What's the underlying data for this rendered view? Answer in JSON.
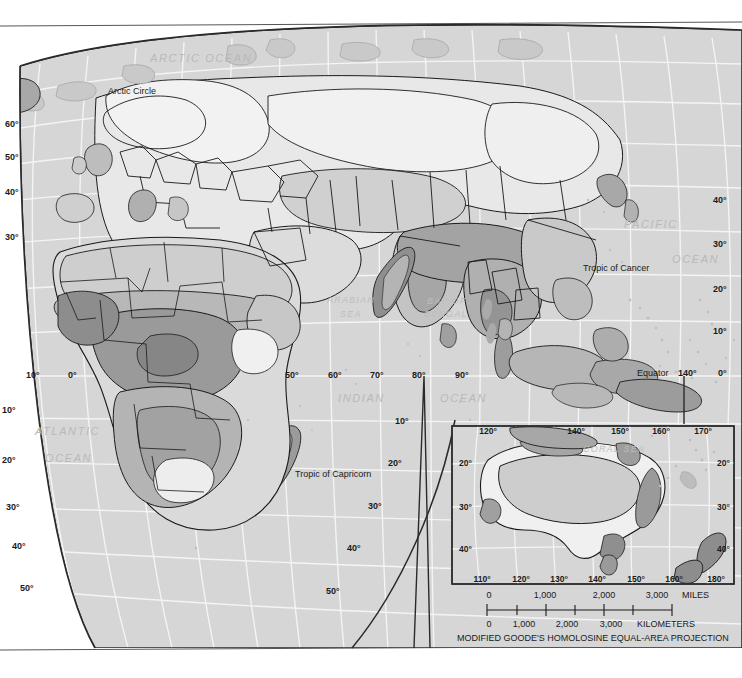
{
  "map": {
    "projection_caption": "MODIFIED GOODE'S HOMOLOSINE EQUAL-AREA PROJECTION",
    "ocean_labels": [
      {
        "name": "arctic-ocean",
        "text": "ARCTIC OCEAN",
        "x": 150,
        "y": 62
      },
      {
        "name": "atlantic-ocean-1",
        "text": "ATLANTIC",
        "x": 35,
        "y": 435
      },
      {
        "name": "atlantic-ocean-2",
        "text": "OCEAN",
        "x": 45,
        "y": 462
      },
      {
        "name": "pacific-ocean-1",
        "text": "PACIFIC",
        "x": 624,
        "y": 228
      },
      {
        "name": "pacific-ocean-2",
        "text": "OCEAN",
        "x": 672,
        "y": 263
      },
      {
        "name": "indian-ocean-1",
        "text": "INDIAN",
        "x": 338,
        "y": 402
      },
      {
        "name": "indian-ocean-2",
        "text": "OCEAN",
        "x": 440,
        "y": 402
      }
    ],
    "sea_labels": [
      {
        "name": "arabian-sea-1",
        "text": "ARABIAN",
        "x": 327,
        "y": 303
      },
      {
        "name": "arabian-sea-2",
        "text": "SEA",
        "x": 340,
        "y": 317
      },
      {
        "name": "bay-of-bengal-1",
        "text": "BAY OF",
        "x": 427,
        "y": 304
      },
      {
        "name": "bay-of-bengal-2",
        "text": "BENGAL",
        "x": 424,
        "y": 317
      },
      {
        "name": "coral-sea",
        "text": "CORAL  SEA",
        "x": 583,
        "y": 452
      }
    ],
    "reference_lines": [
      {
        "name": "arctic-circle",
        "text": "Arctic Circle",
        "x": 108,
        "y": 94
      },
      {
        "name": "tropic-of-cancer",
        "text": "Tropic of Cancer",
        "x": 583,
        "y": 271
      },
      {
        "name": "tropic-of-capricorn",
        "text": "Tropic of Capricorn",
        "x": 295,
        "y": 477
      },
      {
        "name": "equator",
        "text": "Equator",
        "x": 637,
        "y": 376
      }
    ],
    "latitude_labels_left": [
      {
        "text": "60°",
        "x": 5,
        "y": 127
      },
      {
        "text": "50°",
        "x": 5,
        "y": 160
      },
      {
        "text": "40°",
        "x": 5,
        "y": 195
      },
      {
        "text": "30°",
        "x": 5,
        "y": 240
      },
      {
        "text": "10°",
        "x": 2,
        "y": 413
      },
      {
        "text": "20°",
        "x": 2,
        "y": 463
      },
      {
        "text": "30°",
        "x": 6,
        "y": 510
      },
      {
        "text": "40°",
        "x": 12,
        "y": 549
      },
      {
        "text": "50°",
        "x": 20,
        "y": 591
      }
    ],
    "latitude_labels_right": [
      {
        "text": "40°",
        "x": 713,
        "y": 203
      },
      {
        "text": "30°",
        "x": 713,
        "y": 247
      },
      {
        "text": "20°",
        "x": 713,
        "y": 292
      },
      {
        "text": "10°",
        "x": 713,
        "y": 334
      },
      {
        "text": "0°",
        "x": 718,
        "y": 376
      }
    ],
    "latitude_labels_inner_right": [
      {
        "text": "10°",
        "x": 395,
        "y": 424
      },
      {
        "text": "20°",
        "x": 388,
        "y": 466
      },
      {
        "text": "30°",
        "x": 368,
        "y": 509
      },
      {
        "text": "40°",
        "x": 347,
        "y": 551
      },
      {
        "text": "50°",
        "x": 326,
        "y": 594
      }
    ],
    "longitude_labels": [
      {
        "text": "10°",
        "x": 26,
        "y": 378
      },
      {
        "text": "0°",
        "x": 68,
        "y": 378
      },
      {
        "text": "50°",
        "x": 285,
        "y": 378
      },
      {
        "text": "60°",
        "x": 328,
        "y": 378
      },
      {
        "text": "70°",
        "x": 370,
        "y": 378
      },
      {
        "text": "80°",
        "x": 412,
        "y": 378
      },
      {
        "text": "90°",
        "x": 455,
        "y": 378
      },
      {
        "text": "140°",
        "x": 678,
        "y": 376
      }
    ]
  },
  "inset": {
    "name": "australia-new-zealand-inset",
    "longitude_top": [
      {
        "text": "120°",
        "x": 488,
        "y": 434
      },
      {
        "text": "140°",
        "x": 576,
        "y": 434
      },
      {
        "text": "150°",
        "x": 620,
        "y": 434
      },
      {
        "text": "160°",
        "x": 661,
        "y": 434
      },
      {
        "text": "170°",
        "x": 703,
        "y": 434
      }
    ],
    "longitude_bottom": [
      {
        "text": "110°",
        "x": 482,
        "y": 582
      },
      {
        "text": "120°",
        "x": 521,
        "y": 582
      },
      {
        "text": "130°",
        "x": 559,
        "y": 582
      },
      {
        "text": "140°",
        "x": 597,
        "y": 582
      },
      {
        "text": "150°",
        "x": 636,
        "y": 582
      },
      {
        "text": "160°",
        "x": 674,
        "y": 582
      },
      {
        "text": "180°",
        "x": 716,
        "y": 582
      }
    ],
    "latitude_left": [
      {
        "text": "20°",
        "x": 459,
        "y": 466
      },
      {
        "text": "30°",
        "x": 459,
        "y": 510
      },
      {
        "text": "40°",
        "x": 459,
        "y": 552
      }
    ],
    "latitude_right": [
      {
        "text": "20°",
        "x": 717,
        "y": 466
      },
      {
        "text": "30°",
        "x": 717,
        "y": 510
      },
      {
        "text": "40°",
        "x": 717,
        "y": 552
      }
    ]
  },
  "scale": {
    "miles_label": "MILES",
    "kilometers_label": "KILOMETERS",
    "miles_ticks": [
      {
        "text": "0",
        "x": 489
      },
      {
        "text": "1,000",
        "x": 545
      },
      {
        "text": "2,000",
        "x": 604
      },
      {
        "text": "3,000",
        "x": 657
      }
    ],
    "miles_unit_x": 682,
    "km_ticks": [
      {
        "text": "0",
        "x": 489
      },
      {
        "text": "1,000",
        "x": 524
      },
      {
        "text": "2,000",
        "x": 567
      },
      {
        "text": "3,000",
        "x": 611
      }
    ],
    "km_unit_x": 637
  },
  "colors": {
    "ocean": "#d6d6d6",
    "land_light": "#f2f2f2",
    "land_pale": "#e3e3e3",
    "land_mid": "#c6c6c6",
    "land_dark": "#a9a9a9",
    "land_darker": "#8e8e8e",
    "border": "#1a1a1a",
    "graticule": "#f4f4f4",
    "page": "#ffffff"
  }
}
